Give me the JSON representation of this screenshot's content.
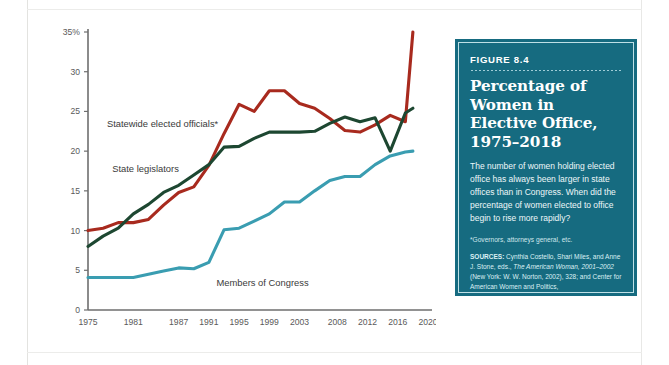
{
  "figure_box": {
    "kicker": "FIGURE 8.4",
    "title": "Percentage of Women in Elective Office, 1975–2018",
    "body": "The number of women holding elected office has always been larger in state offices than in Congress. When did the percentage of women elected to office begin to rise more rapidly?",
    "footnote": "*Governors, attorneys general, etc.",
    "sources_label": "SOURCES:",
    "sources_part1": " Cynthia Costello, Shari Miles, and Anne J. Stone, eds., ",
    "sources_italic": "The American Woman, 2001–2002",
    "sources_part2": " (New York: W. W. Norton, 2002), 328; and Center for American Women and Politics, www.cawp.rutgers.edu (accessed 11/9/18).",
    "background_color": "#166b80",
    "border_color": "#bfe0e6"
  },
  "chart_data": {
    "type": "line",
    "title": "Percentage of Women in Elective Office, 1975–2018",
    "xlabel": "",
    "ylabel": "",
    "ylim": [
      0,
      35
    ],
    "yticks": [
      0,
      5,
      10,
      15,
      20,
      25,
      30,
      35
    ],
    "ytick_labels": [
      "0",
      "5",
      "10",
      "15",
      "20",
      "25",
      "30",
      "35%"
    ],
    "xlim": [
      1975,
      2020
    ],
    "xticks": [
      1975,
      1981,
      1987,
      1991,
      1995,
      1999,
      2003,
      2008,
      2012,
      2016,
      2020
    ],
    "xtick_labels": [
      "1975",
      "1981",
      "1987",
      "1991",
      "1995",
      "1999",
      "2003",
      "2008",
      "2012",
      "2016",
      "2020"
    ],
    "grid": false,
    "legend_position": "inline-labels",
    "series": [
      {
        "name": "Statewide elected officials*",
        "color": "#a82a1e",
        "label_x": 1977.5,
        "label_y": 23.0,
        "x": [
          1975,
          1977,
          1979,
          1981,
          1983,
          1985,
          1987,
          1989,
          1991,
          1993,
          1995,
          1997,
          1999,
          2001,
          2003,
          2005,
          2007,
          2009,
          2011,
          2013,
          2015,
          2017,
          2018
        ],
        "y": [
          10.0,
          10.3,
          11.0,
          11.0,
          11.4,
          13.2,
          14.8,
          15.5,
          18.2,
          22.2,
          25.9,
          25.0,
          27.6,
          27.6,
          26.0,
          25.4,
          24.1,
          22.6,
          22.4,
          23.3,
          24.5,
          23.7,
          35.0
        ]
      },
      {
        "name": "State legislators",
        "color": "#1d4731",
        "label_x": 1978.2,
        "label_y": 17.4,
        "x": [
          1975,
          1977,
          1979,
          1981,
          1983,
          1985,
          1987,
          1989,
          1991,
          1993,
          1995,
          1997,
          1999,
          2001,
          2003,
          2005,
          2007,
          2009,
          2011,
          2013,
          2015,
          2017,
          2018
        ],
        "y": [
          8.0,
          9.3,
          10.3,
          12.1,
          13.3,
          14.8,
          15.7,
          17.0,
          18.3,
          20.5,
          20.6,
          21.6,
          22.4,
          22.4,
          22.4,
          22.5,
          23.5,
          24.3,
          23.7,
          24.2,
          20.0,
          24.8,
          25.4
        ]
      },
      {
        "name": "Members of Congress",
        "color": "#3a9db1",
        "label_x": 1992.0,
        "label_y": 3.0,
        "x": [
          1975,
          1977,
          1979,
          1981,
          1983,
          1985,
          1987,
          1989,
          1991,
          1993,
          1995,
          1997,
          1999,
          2001,
          2003,
          2005,
          2007,
          2009,
          2011,
          2013,
          2015,
          2017,
          2018
        ],
        "y": [
          4.1,
          4.1,
          4.1,
          4.1,
          4.5,
          4.9,
          5.3,
          5.2,
          6.0,
          10.1,
          10.3,
          11.2,
          12.1,
          13.6,
          13.6,
          15.0,
          16.3,
          16.8,
          16.8,
          18.3,
          19.4,
          19.9,
          20.0
        ]
      }
    ]
  }
}
